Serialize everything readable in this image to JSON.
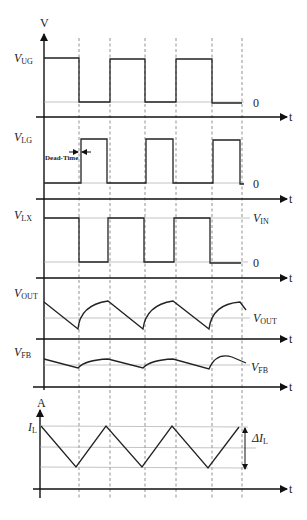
{
  "diagram": {
    "axis_labels": {
      "voltage": "V",
      "current": "A",
      "time": "t"
    },
    "dead_time_label": "Dead-Time",
    "signals": [
      {
        "id": "ug",
        "name": "V",
        "sub": "UG",
        "level_high": "",
        "level_low": "0"
      },
      {
        "id": "lg",
        "name": "V",
        "sub": "LG",
        "level_low": "0"
      },
      {
        "id": "lx",
        "name": "V",
        "sub": "LX",
        "level_high_name": "V",
        "level_high_sub": "IN",
        "level_low": "0"
      },
      {
        "id": "vout",
        "name": "V",
        "sub": "OUT",
        "ref_name": "V",
        "ref_sub": "OUT"
      },
      {
        "id": "vfb",
        "name": "V",
        "sub": "FB",
        "ref_name": "V",
        "ref_sub": "FB"
      },
      {
        "id": "il",
        "name": "I",
        "sub": "L",
        "delta_name": "ΔI",
        "delta_sub": "L"
      }
    ],
    "colors": {
      "waveform": "#222222",
      "axis": "#111111",
      "dashed_guides": "#777777",
      "reference_lines": "#aaaaaa"
    }
  }
}
